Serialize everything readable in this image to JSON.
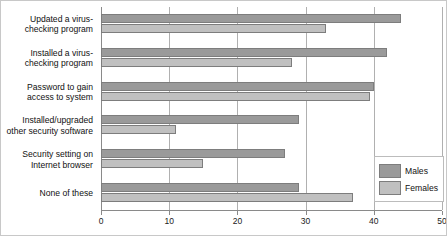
{
  "chart_data": {
    "type": "bar",
    "orientation": "horizontal",
    "title": "",
    "subtitle": "",
    "xlabel": "",
    "ylabel": "",
    "xlim": [
      0,
      50
    ],
    "xticks": [
      0,
      10,
      20,
      30,
      40,
      50
    ],
    "xticklabels": [
      "0",
      "10",
      "20",
      "30",
      "40",
      "50"
    ],
    "grid": true,
    "grid_axis": "x",
    "legend_position": "bottom-right",
    "categories": [
      "Updated a virus-checking program",
      "Installed a virus-checking program",
      "Password to gain access to system",
      "Installed/upgraded other security software",
      "Security setting on Internet browser",
      "None of these"
    ],
    "series": [
      {
        "name": "Males",
        "color": "#9a9a9a",
        "values": [
          44,
          42,
          40,
          29,
          27,
          29
        ]
      },
      {
        "name": "Females",
        "color": "#c0c0c0",
        "values": [
          33,
          28,
          39.5,
          11,
          15,
          37
        ]
      }
    ]
  },
  "legend": {
    "entries": [
      {
        "label": "Males"
      },
      {
        "label": "Females"
      }
    ]
  },
  "colors": {
    "males_bar": "#9a9a9a",
    "females_bar": "#c0c0c0",
    "bar_border": "#7d7d7d",
    "gridline": "#b0b0b0",
    "axis": "#8a8a8a",
    "frame": "#c8c8c8",
    "text": "#111111",
    "background": "#ffffff"
  }
}
